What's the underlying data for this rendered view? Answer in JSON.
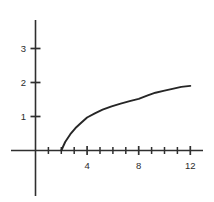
{
  "chart_data": {
    "type": "line",
    "title": "",
    "subtitle": "",
    "xlabel": "",
    "ylabel": "",
    "xlim": [
      -1,
      13.2
    ],
    "ylim": [
      -1.6,
      3.6
    ],
    "grid": false,
    "legend": null,
    "x_ticks": [
      1,
      2,
      3,
      4,
      5,
      6,
      7,
      8,
      9,
      10,
      11,
      12
    ],
    "x_tick_labels": [
      "",
      "",
      "",
      "4",
      "",
      "",
      "",
      "8",
      "",
      "",
      "",
      "12"
    ],
    "x_labeled_ticks": [
      {
        "value": 4,
        "label": "4"
      },
      {
        "value": 8,
        "label": "8"
      },
      {
        "value": 12,
        "label": "12"
      }
    ],
    "y_ticks": [
      1,
      2,
      3
    ],
    "y_tick_labels": [
      "1",
      "2",
      "3"
    ],
    "y_labeled_ticks": [
      {
        "value": 1,
        "label": "1"
      },
      {
        "value": 2,
        "label": "2"
      },
      {
        "value": 3,
        "label": "3"
      }
    ],
    "series": [
      {
        "name": "curve",
        "color": "#262626",
        "x": [
          2.0,
          2.3,
          2.7,
          3.1,
          3.5,
          4.0,
          4.6,
          5.2,
          5.9,
          6.6,
          7.3,
          8.0,
          8.7,
          9.3,
          10.0,
          10.7,
          11.3,
          12.0
        ],
        "values": [
          0.0,
          0.25,
          0.48,
          0.66,
          0.8,
          0.97,
          1.09,
          1.2,
          1.3,
          1.38,
          1.45,
          1.52,
          1.62,
          1.7,
          1.76,
          1.82,
          1.87,
          1.9
        ]
      }
    ],
    "axis_color": "#2f2f2f",
    "background_color": "#ffffff"
  }
}
